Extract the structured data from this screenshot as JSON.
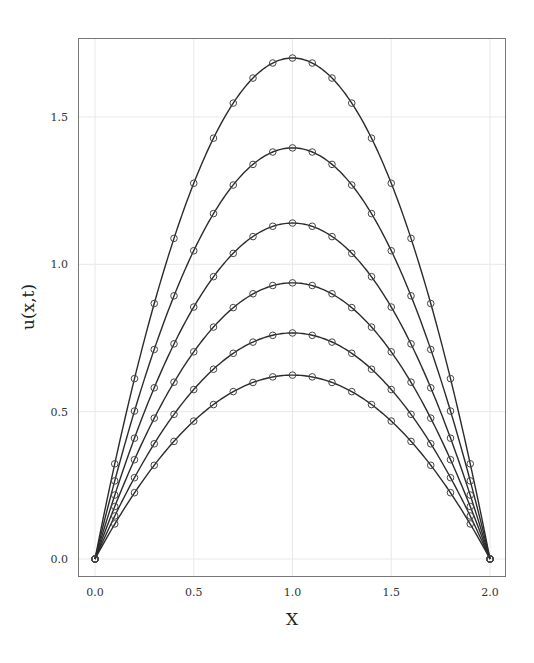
{
  "chart_data": {
    "type": "line",
    "title": "",
    "xlabel": "X",
    "ylabel": "u(x,t)",
    "xlim": [
      -0.08,
      2.08
    ],
    "ylim": [
      -0.06,
      1.79
    ],
    "xticks": [
      0.0,
      0.5,
      1.0,
      1.5,
      2.0
    ],
    "xtick_labels": [
      "0.0",
      "0.5",
      "1.0",
      "1.5",
      "2.0"
    ],
    "yticks": [
      0.0,
      0.5,
      1.0,
      1.5
    ],
    "ytick_labels": [
      "0.0",
      "0.5",
      "1.0",
      "1.5"
    ],
    "grid": true,
    "legend": null,
    "marker": "open-circle",
    "x": [
      0.0,
      0.1,
      0.2,
      0.3,
      0.4,
      0.5,
      0.6,
      0.7,
      0.8,
      0.9,
      1.0,
      1.1,
      1.2,
      1.3,
      1.4,
      1.5,
      1.6,
      1.7,
      1.8,
      1.9,
      2.0
    ],
    "series": [
      {
        "name": "curve-1",
        "peak": 1.7,
        "values": [
          0.0,
          0.323,
          0.612,
          0.867,
          1.088,
          1.275,
          1.428,
          1.547,
          1.632,
          1.683,
          1.7,
          1.683,
          1.632,
          1.547,
          1.428,
          1.275,
          1.088,
          0.867,
          0.612,
          0.323,
          0.0
        ]
      },
      {
        "name": "curve-2",
        "peak": 1.395,
        "values": [
          0.0,
          0.265,
          0.502,
          0.711,
          0.893,
          1.046,
          1.172,
          1.269,
          1.339,
          1.381,
          1.395,
          1.381,
          1.339,
          1.269,
          1.172,
          1.046,
          0.893,
          0.711,
          0.502,
          0.265,
          0.0
        ]
      },
      {
        "name": "curve-3",
        "peak": 1.14,
        "values": [
          0.0,
          0.217,
          0.41,
          0.581,
          0.73,
          0.855,
          0.958,
          1.037,
          1.094,
          1.129,
          1.14,
          1.129,
          1.094,
          1.037,
          0.958,
          0.855,
          0.73,
          0.581,
          0.41,
          0.217,
          0.0
        ]
      },
      {
        "name": "curve-4",
        "peak": 0.937,
        "values": [
          0.0,
          0.178,
          0.337,
          0.478,
          0.6,
          0.703,
          0.787,
          0.853,
          0.9,
          0.928,
          0.937,
          0.928,
          0.9,
          0.853,
          0.787,
          0.703,
          0.6,
          0.478,
          0.337,
          0.178,
          0.0
        ]
      },
      {
        "name": "curve-5",
        "peak": 0.767,
        "values": [
          0.0,
          0.146,
          0.276,
          0.391,
          0.491,
          0.575,
          0.644,
          0.698,
          0.736,
          0.759,
          0.767,
          0.759,
          0.736,
          0.698,
          0.644,
          0.575,
          0.491,
          0.391,
          0.276,
          0.146,
          0.0
        ]
      },
      {
        "name": "curve-6",
        "peak": 0.624,
        "values": [
          0.0,
          0.119,
          0.225,
          0.318,
          0.399,
          0.468,
          0.524,
          0.568,
          0.599,
          0.618,
          0.624,
          0.618,
          0.599,
          0.568,
          0.524,
          0.468,
          0.399,
          0.318,
          0.225,
          0.119,
          0.0
        ]
      }
    ]
  },
  "colors": {
    "line": "#2b2b2b",
    "marker_edge": "#444444",
    "grid": "#e8e8e8",
    "frame": "#777777",
    "background": "#ffffff"
  }
}
